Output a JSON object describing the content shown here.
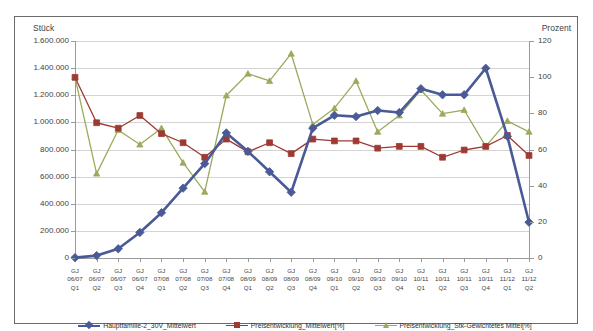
{
  "top_strip": {
    "left_fragment": "",
    "right_fragment": ""
  },
  "axes": {
    "left_title": "Stück",
    "right_title": "Prozent",
    "left_ticks": [
      "1.600.000",
      "1.400.000",
      "1.200.000",
      "1.000.000",
      "800.000",
      "600.000",
      "400.000",
      "200.000",
      "0"
    ],
    "right_ticks": [
      "120",
      "100",
      "80",
      "60",
      "40",
      "20",
      "0"
    ]
  },
  "legend": {
    "items": [
      {
        "label": "Hauptfamilie-2_30V_Mittelwert",
        "color": "#4a5a96",
        "marker": "diamond"
      },
      {
        "label": "Preisentwicklung_Mittelwert[%]",
        "color": "#9e3a33",
        "marker": "square"
      },
      {
        "label": "Preisentwicklung_Stk-Gewichtetes Mittel[%]",
        "color": "#9aab5c",
        "marker": "triangle"
      }
    ]
  },
  "chart_data": {
    "type": "line",
    "title": "",
    "xlabel": "",
    "ylabel": "Stück",
    "y2label": "Prozent",
    "ylim": [
      0,
      1600000
    ],
    "y2lim": [
      0,
      120
    ],
    "grid": true,
    "legend_position": "bottom",
    "categories": [
      "GJ 06/07 Q1",
      "GJ 06/07 Q2",
      "GJ 06/07 Q3",
      "GJ 06/07 Q4",
      "GJ 07/08 Q1",
      "GJ 07/08 Q2",
      "GJ 07/08 Q3",
      "GJ 07/08 Q4",
      "GJ 08/09 Q1",
      "GJ 08/09 Q2",
      "GJ 08/09 Q3",
      "GJ 08/09 Q4",
      "GJ 09/10 Q1",
      "GJ 09/10 Q2",
      "GJ 09/10 Q3",
      "GJ 09/10 Q4",
      "GJ 10/11 Q1",
      "GJ 10/11 Q2",
      "GJ 10/11 Q3",
      "GJ 10/11 Q4",
      "GJ 11/12 Q1",
      "GJ 11/12 Q2"
    ],
    "category_rows": {
      "row1": [
        "GJ",
        "GJ",
        "GJ",
        "GJ",
        "GJ",
        "GJ",
        "GJ",
        "GJ",
        "GJ",
        "GJ",
        "GJ",
        "GJ",
        "GJ",
        "GJ",
        "GJ",
        "GJ",
        "GJ",
        "GJ",
        "GJ",
        "GJ",
        "GJ",
        "GJ"
      ],
      "row2": [
        "06/07",
        "06/07",
        "06/07",
        "06/07",
        "07/08",
        "07/08",
        "07/08",
        "07/08",
        "08/09",
        "08/09",
        "08/09",
        "08/09",
        "09/10",
        "09/10",
        "09/10",
        "09/10",
        "10/11",
        "10/11",
        "10/11",
        "10/11",
        "11/12",
        "11/12"
      ],
      "row3": [
        "Q1",
        "Q2",
        "Q3",
        "Q4",
        "Q1",
        "Q2",
        "Q3",
        "Q4",
        "Q1",
        "Q2",
        "Q3",
        "Q4",
        "Q1",
        "Q2",
        "Q3",
        "Q4",
        "Q1",
        "Q2",
        "Q3",
        "Q4",
        "Q1",
        "Q2"
      ]
    },
    "series": [
      {
        "name": "Hauptfamilie-2_30V_Mittelwert",
        "axis": "left",
        "color": "#4a5a96",
        "marker": "diamond",
        "values": [
          10000,
          25000,
          75000,
          195000,
          340000,
          520000,
          700000,
          925000,
          790000,
          640000,
          490000,
          960000,
          1055000,
          1045000,
          1090000,
          1075000,
          1250000,
          1205000,
          1205000,
          1400000,
          900000,
          270000
        ]
      },
      {
        "name": "Preisentwicklung_Mittelwert[%]",
        "axis": "right",
        "color": "#9e3a33",
        "marker": "square",
        "values": [
          100,
          75,
          72,
          79,
          69,
          64,
          56,
          66,
          59,
          64,
          58,
          66,
          65,
          65,
          61,
          62,
          62,
          56,
          60,
          62,
          68,
          57
        ]
      },
      {
        "name": "Preisentwicklung_Stk-Gewichtetes Mittel[%]",
        "axis": "right",
        "color": "#9aab5c",
        "marker": "triangle",
        "values": [
          100,
          47,
          71,
          63,
          72,
          53,
          37,
          90,
          102,
          98,
          113,
          74,
          83,
          98,
          70,
          79,
          93,
          80,
          82,
          62,
          76,
          70
        ]
      }
    ]
  }
}
